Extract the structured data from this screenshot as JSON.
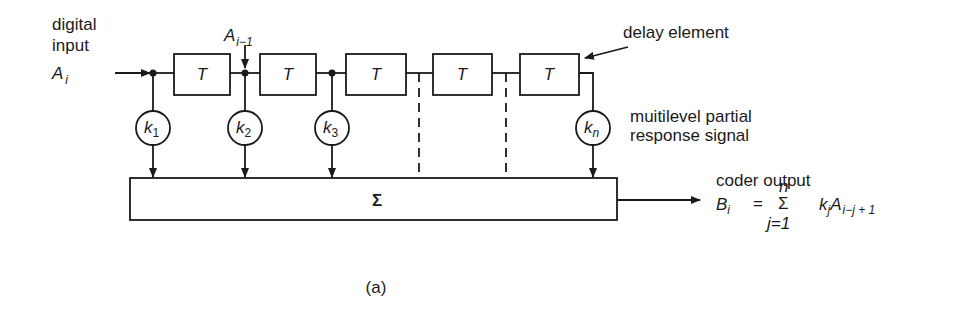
{
  "figure": {
    "caption": "(a)",
    "input_label_line1": "digital",
    "input_label_line2": "input",
    "input_symbol": "A",
    "input_symbol_sub": "i",
    "tap_label_symbol": "A",
    "tap_label_sub": "i−1",
    "delay_symbol": "T",
    "delay_element_label": "delay element",
    "multilevel_label_line1": "muitilevel partial",
    "multilevel_label_line2": "response signal",
    "summer_symbol": "Σ",
    "output_label": "coder output",
    "equation": {
      "lhs": "B",
      "lhs_sub": "i",
      "equals": "=",
      "sum": "Σ",
      "upper": "n",
      "lower": "j=1",
      "term_k": "k",
      "term_k_sub": "j",
      "term_a": "A",
      "term_a_sub": "i−j + 1"
    },
    "coefficients": [
      {
        "symbol": "k",
        "sub": "1"
      },
      {
        "symbol": "k",
        "sub": "2"
      },
      {
        "symbol": "k",
        "sub": "3"
      },
      {
        "symbol": "k",
        "sub": "n"
      }
    ],
    "delays": [
      "T",
      "T",
      "T",
      "T",
      "T"
    ]
  }
}
